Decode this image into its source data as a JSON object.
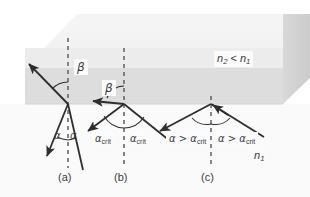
{
  "media_labels": {
    "upper": {
      "symbol": "n",
      "sub1": "2",
      "relation": "<",
      "symbol2": "n",
      "sub2": "1",
      "text": "n2 < n1"
    },
    "lower": {
      "symbol": "n",
      "sub": "1",
      "text": "n1"
    }
  },
  "panels": [
    {
      "id": "a",
      "caption": "(a)",
      "caption_x": 68,
      "caption_y": 176,
      "normal_x": 68,
      "angles": [
        {
          "name": "beta",
          "glyph": "β",
          "x": 76,
          "y": 61
        },
        {
          "name": "alpha-incident",
          "glyph": "α",
          "x": 56,
          "y": 134
        },
        {
          "name": "alpha-reflected",
          "glyph": "α",
          "x": 71,
          "y": 134
        }
      ]
    },
    {
      "id": "b",
      "caption": "(b)",
      "caption_x": 124,
      "caption_y": 176,
      "normal_x": 124,
      "angles": [
        {
          "name": "beta-grazing",
          "glyph": "β",
          "x": 105,
          "y": 82
        }
      ],
      "crit_labels": [
        {
          "name": "alpha-crit-incident",
          "glyph": "α",
          "sub": "crit",
          "x": 96,
          "y": 136
        },
        {
          "name": "alpha-crit-reflected",
          "glyph": "α",
          "sub": "crit",
          "x": 130,
          "y": 136
        }
      ]
    },
    {
      "id": "c",
      "caption": "(c)",
      "caption_x": 211,
      "caption_y": 176,
      "normal_x": 211,
      "tir_labels": [
        {
          "name": "alpha-gt-crit-incident",
          "pre": "α > α",
          "sub": "crit",
          "x": 172,
          "y": 136
        },
        {
          "name": "alpha-gt-crit-reflected",
          "pre": "α > α",
          "sub": "crit",
          "x": 216,
          "y": 136
        }
      ]
    }
  ],
  "colors": {
    "ray": "#2e2e2e",
    "normal_dash": "#555555",
    "slab_top": "#f2f2f2",
    "slab_front_upper": "#e8e8e8",
    "slab_front_band": "#dcdcdc",
    "slab_side": "#d2d2d2",
    "lower_medium": "#fafafa",
    "label_text": "#3a3a3a",
    "label_box": "#fbfbfb",
    "background": "#ffffff"
  },
  "geometry": {
    "interface_y": 104,
    "top_band_y": 68,
    "slab_top_back_y": 14,
    "slab_right_x": 283,
    "slab_left_x": 25
  }
}
